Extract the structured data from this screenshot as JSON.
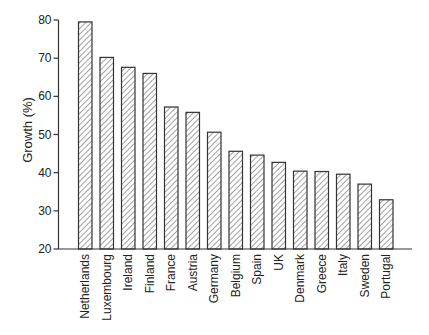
{
  "chart_data": {
    "type": "bar",
    "title": "",
    "xlabel": "",
    "ylabel": "Growth (%)",
    "ylim": [
      20,
      80
    ],
    "yticks": [
      20,
      30,
      40,
      50,
      60,
      70,
      80
    ],
    "grid": false,
    "legend": null,
    "bar_style": "diagonal-hatch",
    "categories": [
      "Netherlands",
      "Luxembourg",
      "Ireland",
      "Finland",
      "France",
      "Austria",
      "Germany",
      "Belgium",
      "Spain",
      "UK",
      "Denmark",
      "Greece",
      "Italy",
      "Sweden",
      "Portugal"
    ],
    "values": [
      79.5,
      70.2,
      67.6,
      66.0,
      57.2,
      55.8,
      50.6,
      45.6,
      44.6,
      42.7,
      40.4,
      40.3,
      39.6,
      37.0,
      32.9
    ]
  },
  "colors": {
    "bar_stroke": "#333333",
    "hatch": "#555555",
    "axis": "#333333",
    "background": "#ffffff"
  }
}
